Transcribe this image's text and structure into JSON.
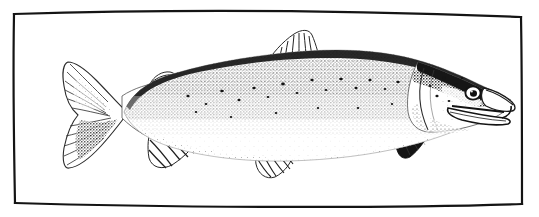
{
  "figure": {
    "kind": "scanned-engraving-illustration",
    "subject_label": "Atlantic salmon (spawning male, side view, facing right)",
    "medium": "black-and-white stipple / line engraving, scanned halftone",
    "caption": "",
    "title": "",
    "width_px": 539,
    "height_px": 217,
    "background_color": "#ffffff",
    "ink_color": "#1a1a1a",
    "has_text": false
  },
  "frame": {
    "name": "hand-drawn rectangular border",
    "style": "single thin irregular ruled line, slightly bowed edges",
    "color": "#141414",
    "stroke_width_px": 2.2,
    "inset": {
      "left": 14,
      "top": 13,
      "right": 521,
      "bottom": 204
    },
    "corners": [
      {
        "label": "top-left",
        "x": 14,
        "y": 14
      },
      {
        "label": "top-right",
        "x": 521,
        "y": 17
      },
      {
        "label": "bottom-right",
        "x": 522,
        "y": 204
      },
      {
        "label": "bottom-left",
        "x": 15,
        "y": 203
      }
    ]
  },
  "fish": {
    "orientation": "facing right",
    "bounding_box": {
      "x": 60,
      "y": 30,
      "width": 450,
      "height": 148
    },
    "shading": {
      "back_tone": "dark dense stipple",
      "flank_tone": "pale / white with scattered spots",
      "belly_tone": "white, unshaded",
      "spot_count_visible": 22
    },
    "parts": [
      {
        "name": "caudal-fin",
        "label": "Caudal fin (tail)",
        "shape": "forked, ray-striped",
        "box": {
          "x": 61,
          "y": 61,
          "width": 66,
          "height": 108
        }
      },
      {
        "name": "caudal-peduncle",
        "label": "Caudal peduncle",
        "box": {
          "x": 118,
          "y": 88,
          "width": 42,
          "height": 46
        }
      },
      {
        "name": "adipose-fin",
        "label": "Adipose fin",
        "shape": "small fleshy lobe on dorsal ridge",
        "box": {
          "x": 150,
          "y": 72,
          "width": 28,
          "height": 14
        }
      },
      {
        "name": "anal-fin",
        "label": "Anal fin",
        "shape": "triangular, striped rays",
        "box": {
          "x": 147,
          "y": 126,
          "width": 56,
          "height": 42
        }
      },
      {
        "name": "dorsal-fin",
        "label": "Dorsal fin",
        "shape": "triangular, striped rays",
        "box": {
          "x": 262,
          "y": 31,
          "width": 62,
          "height": 40
        }
      },
      {
        "name": "pelvic-fin",
        "label": "Pelvic fin",
        "shape": "rounded, striped rays",
        "box": {
          "x": 254,
          "y": 148,
          "width": 42,
          "height": 30
        }
      },
      {
        "name": "pectoral-fin",
        "label": "Pectoral fin",
        "shape": "dark solid blade",
        "box": {
          "x": 390,
          "y": 128,
          "width": 42,
          "height": 32
        }
      },
      {
        "name": "operculum",
        "label": "Gill cover (operculum)",
        "box": {
          "x": 418,
          "y": 70,
          "width": 46,
          "height": 62
        }
      },
      {
        "name": "eye",
        "label": "Eye",
        "shape": "dark ring with pale iris and black pupil",
        "center": {
          "x": 473,
          "y": 93
        },
        "radius_px": 7
      },
      {
        "name": "kype-jaw",
        "label": "Hooked lower jaw (kype)",
        "box": {
          "x": 470,
          "y": 92,
          "width": 42,
          "height": 30
        }
      },
      {
        "name": "snout",
        "label": "Snout",
        "box": {
          "x": 486,
          "y": 82,
          "width": 26,
          "height": 22
        }
      }
    ]
  }
}
